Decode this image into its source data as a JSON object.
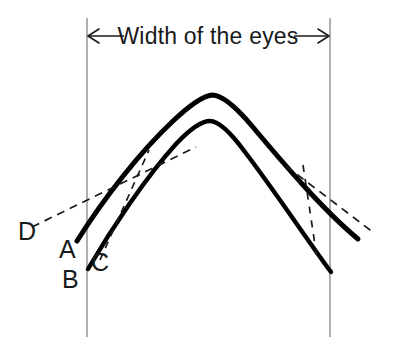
{
  "figure": {
    "title": "Width of the eyes",
    "background_color": "#ffffff",
    "ink_color": "#000000",
    "guide_color": "#6e6e6e",
    "width": 394,
    "height": 357
  },
  "dimension": {
    "label": "Width of the eyes",
    "left_arrow_icon": "arrow-left-icon",
    "right_arrow_icon": "arrow-right-icon",
    "left_bound_x": 87,
    "right_bound_x": 330,
    "arrow_y": 36
  },
  "reference_lines": [
    {
      "name": "left-reference-line",
      "x": 87,
      "y1": 18,
      "y2": 337
    },
    {
      "name": "right-reference-line",
      "x": 330,
      "y1": 18,
      "y2": 337
    }
  ],
  "labels": [
    {
      "id": "D",
      "text": "D",
      "x": 18,
      "y": 240
    },
    {
      "id": "A",
      "text": "A",
      "x": 59,
      "y": 258
    },
    {
      "id": "B",
      "text": "B",
      "x": 62,
      "y": 288
    },
    {
      "id": "C",
      "text": "C",
      "x": 91,
      "y": 271
    }
  ],
  "curves": [
    {
      "name": "outer-arch-curve",
      "description": "outer pointed arch, thick stroke, ends at A on the left",
      "stroke_width": 5,
      "apex": [
        212,
        95
      ],
      "left_end": [
        77,
        241
      ],
      "right_end": [
        358,
        239
      ]
    },
    {
      "name": "inner-arch-curve",
      "description": "inner pointed arch, thick stroke, ends at B on the left",
      "stroke_width": 4.4,
      "apex": [
        210,
        121
      ],
      "left_end": [
        88,
        269
      ],
      "right_end": [
        331,
        272
      ]
    }
  ],
  "tangents": [
    {
      "name": "left-tangent-dashed-line",
      "from_label": "D",
      "points": [
        [
          32,
          227
        ],
        [
          196,
          147
        ]
      ]
    },
    {
      "name": "left-short-tangent-dashed-line",
      "from_label": "C",
      "points": [
        [
          100,
          258
        ],
        [
          148,
          152
        ]
      ]
    },
    {
      "name": "right-tangent-dashed-line",
      "points": [
        [
          288,
          168
        ],
        [
          374,
          232
        ]
      ]
    },
    {
      "name": "right-short-tangent-dashed-line",
      "points": [
        [
          303,
          166
        ],
        [
          317,
          256
        ]
      ]
    }
  ]
}
